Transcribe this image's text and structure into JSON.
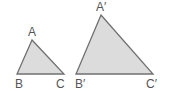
{
  "diagram": {
    "colors": {
      "fill": "#dcdcdc",
      "stroke": "#707070",
      "label": "#555555"
    },
    "triangles": [
      {
        "name": "ABC",
        "points": "32,40 17,74 64,74",
        "labels": [
          {
            "text": "A",
            "x": 28,
            "y": 36
          },
          {
            "text": "B",
            "x": 15,
            "y": 88
          },
          {
            "text": "C",
            "x": 56,
            "y": 88
          }
        ]
      },
      {
        "name": "A'B'C'",
        "points": "101,15 76,74 153,74",
        "labels": [
          {
            "text": "A′",
            "x": 96,
            "y": 11
          },
          {
            "text": "B′",
            "x": 75,
            "y": 88
          },
          {
            "text": "C′",
            "x": 146,
            "y": 88
          }
        ]
      }
    ]
  }
}
